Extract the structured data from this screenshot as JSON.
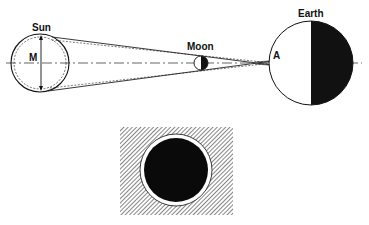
{
  "diagram": {
    "labels": {
      "sun": "Sun",
      "moon": "Moon",
      "earth": "Earth",
      "diameter": "M",
      "point": "A"
    },
    "colors": {
      "ink": "#111111",
      "background": "#ffffff",
      "hatch": "#555555"
    },
    "inset": {
      "description": "Total eclipse view: dark lunar disc with bright corona ring on hatched sky"
    }
  }
}
